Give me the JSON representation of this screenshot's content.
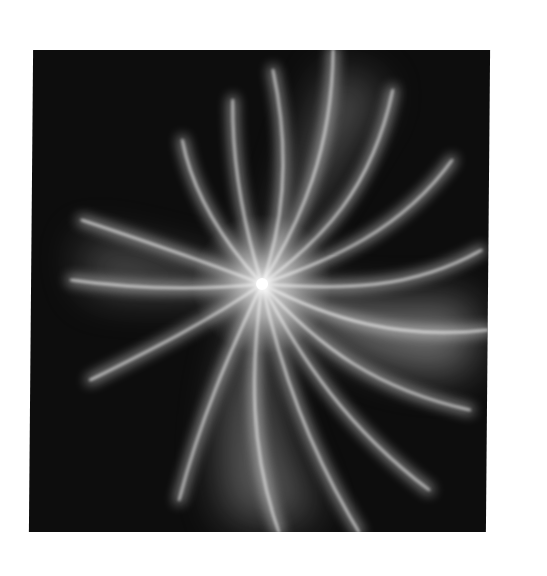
{
  "image": {
    "description": "Abstract white light swirl burst on black square background",
    "background_color": "#ffffff",
    "panel_color": "#0d0d0d",
    "glow_color": "#ffffff",
    "burst_center": {
      "x": 231,
      "y": 234
    }
  }
}
